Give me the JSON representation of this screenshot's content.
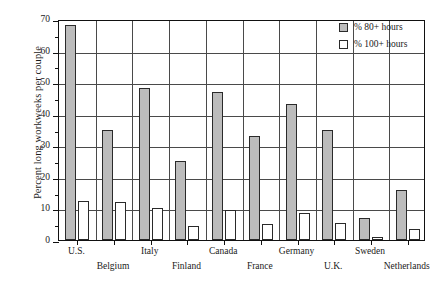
{
  "chart_data": {
    "type": "bar",
    "title": "",
    "xlabel": "",
    "ylabel": "Percent long workweeks per couple",
    "ylim": [
      0,
      70
    ],
    "ytick_step": 10,
    "yticks": [
      "0",
      "10",
      "20",
      "30",
      "40",
      "50",
      "60",
      "70"
    ],
    "grid": "horizontal-and-vertical",
    "legend_position": "top-right",
    "categories": [
      "U.S.",
      "Belgium",
      "Italy",
      "Finland",
      "Canada",
      "France",
      "Germany",
      "U.K.",
      "Sweden",
      "Netherlands"
    ],
    "series": [
      {
        "name": "% 80+ hours",
        "style": "gray-filled",
        "color": "#bcbcbc",
        "values": [
          68,
          35,
          48,
          25,
          47,
          33,
          43,
          35,
          7,
          16
        ]
      },
      {
        "name": "% 100+ hours",
        "style": "white-open",
        "color": "#ffffff",
        "values": [
          12.5,
          12,
          10,
          4.5,
          9.5,
          5,
          8.5,
          5.5,
          1,
          3.5
        ]
      }
    ]
  },
  "legend": {
    "items": [
      {
        "label": "% 80+ hours",
        "swatch": "gray"
      },
      {
        "label": "% 100+ hours",
        "swatch": "white"
      }
    ]
  },
  "axis": {
    "y_title": "Percent long workweeks per couple",
    "y_labels": [
      "70",
      "60",
      "50",
      "40",
      "30",
      "20",
      "10",
      "0"
    ],
    "x_labels": [
      "U.S.",
      "Belgium",
      "Italy",
      "Finland",
      "Canada",
      "France",
      "Germany",
      "U.K.",
      "Sweden",
      "Netherlands"
    ]
  }
}
